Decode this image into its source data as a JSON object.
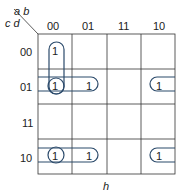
{
  "kmap": {
    "corner": {
      "top_vars": "a b",
      "left_vars": "c d"
    },
    "col_headers": [
      "00",
      "01",
      "11",
      "10"
    ],
    "row_headers": [
      "00",
      "01",
      "11",
      "10"
    ],
    "cells": [
      [
        "1",
        "",
        "",
        ""
      ],
      [
        "1",
        "1",
        "",
        "1"
      ],
      [
        "",
        "",
        "",
        ""
      ],
      [
        "1",
        "1",
        "",
        "1"
      ]
    ],
    "bottom_label": "h",
    "colors": {
      "grid": "#333333",
      "loop": "#2b4a6b"
    }
  }
}
